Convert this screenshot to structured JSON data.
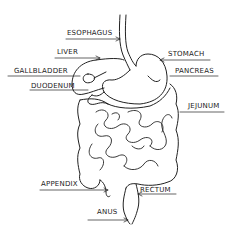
{
  "diagram": {
    "stroke_color": "#222222",
    "background": "#ffffff",
    "labels": {
      "esophagus": "ESOPHAGUS",
      "liver": "LIVER",
      "stomach": "STOMACH",
      "gallbladder": "GALLBLADDER",
      "pancreas": "PANCREAS",
      "duodenum": "DUODENUM",
      "jejunum": "JEJUNUM",
      "appendix": "APPENDIX",
      "rectum": "RECTUM",
      "anus": "ANUS"
    }
  }
}
